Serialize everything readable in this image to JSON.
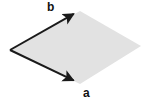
{
  "figure": {
    "kind": "vector-parallelogram-diagram",
    "width": 143,
    "height": 100,
    "background_color": "#ffffff"
  },
  "parallelogram": {
    "name": "vector-parallelogram",
    "fill_color": "#e2e2e2",
    "stroke_color": "none",
    "vertices": [
      {
        "name": "origin",
        "x": 10,
        "y": 50
      },
      {
        "name": "b-tip",
        "x": 80,
        "y": 11
      },
      {
        "name": "far",
        "x": 141,
        "y": 46
      },
      {
        "name": "a-tip",
        "x": 80,
        "y": 84
      }
    ]
  },
  "vectors": [
    {
      "id": "b",
      "label": "b",
      "name": "vector-b",
      "color": "#1a1a1a",
      "stroke_width": 2,
      "start_x": 10,
      "start_y": 50,
      "end_x": 79,
      "end_y": 11,
      "label_x": 47,
      "label_y": 1
    },
    {
      "id": "a",
      "label": "a",
      "name": "vector-a",
      "color": "#1a1a1a",
      "stroke_width": 2,
      "start_x": 10,
      "start_y": 50,
      "end_x": 79,
      "end_y": 83,
      "label_x": 83,
      "label_y": 87
    }
  ],
  "labels": {
    "b": "b",
    "a": "a"
  },
  "colors": {
    "fill": "#e2e2e2",
    "arrow": "#1a1a1a",
    "text": "#111111",
    "background": "#ffffff"
  }
}
